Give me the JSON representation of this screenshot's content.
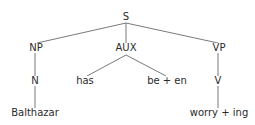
{
  "diagram": {
    "type": "syntax-tree",
    "nodes": {
      "s": "S",
      "np": "NP",
      "aux": "AUX",
      "vp": "VP",
      "n": "N",
      "has": "has",
      "be_en": "be + en",
      "v": "V",
      "balthazar": "Balthazar",
      "worry_ing": "worry + ing"
    },
    "edges": [
      [
        "S",
        "NP"
      ],
      [
        "S",
        "AUX"
      ],
      [
        "S",
        "VP"
      ],
      [
        "NP",
        "N"
      ],
      [
        "N",
        "Balthazar"
      ],
      [
        "AUX",
        "has"
      ],
      [
        "AUX",
        "be + en"
      ],
      [
        "VP",
        "V"
      ],
      [
        "V",
        "worry + ing"
      ]
    ]
  }
}
